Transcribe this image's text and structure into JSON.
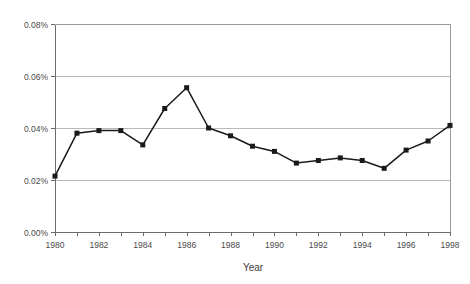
{
  "chart_data": {
    "type": "line",
    "title": "",
    "subtitle": "",
    "xlabel": "Year",
    "ylabel": "",
    "x": [
      1980,
      1981,
      1982,
      1983,
      1984,
      1985,
      1986,
      1987,
      1988,
      1989,
      1990,
      1991,
      1992,
      1993,
      1994,
      1995,
      1996,
      1997,
      1998
    ],
    "values": [
      0.0215,
      0.038,
      0.039,
      0.039,
      0.0335,
      0.0475,
      0.0555,
      0.04,
      0.037,
      0.033,
      0.031,
      0.0265,
      0.0275,
      0.0285,
      0.0275,
      0.0245,
      0.0315,
      0.035,
      0.041
    ],
    "value_unit": "percent",
    "series": [
      {
        "name": "",
        "values": [
          0.0215,
          0.038,
          0.039,
          0.039,
          0.0335,
          0.0475,
          0.0555,
          0.04,
          0.037,
          0.033,
          0.031,
          0.0265,
          0.0275,
          0.0285,
          0.0275,
          0.0245,
          0.0315,
          0.035,
          0.041
        ],
        "marker": "square",
        "color": "#1a1a1a"
      }
    ],
    "ylim": [
      0.0,
      0.08
    ],
    "xlim": [
      1980,
      1998
    ],
    "ytick_values": [
      0.0,
      0.02,
      0.04,
      0.06,
      0.08
    ],
    "ytick_labels": [
      "0.00%",
      "0.02%",
      "0.04%",
      "0.06%",
      "0.08%"
    ],
    "xtick_values": [
      1980,
      1981,
      1982,
      1983,
      1984,
      1985,
      1986,
      1987,
      1988,
      1989,
      1990,
      1991,
      1992,
      1993,
      1994,
      1995,
      1996,
      1997,
      1998
    ],
    "xtick_labels_shown": [
      "1980",
      "1982",
      "1984",
      "1986",
      "1988",
      "1990",
      "1992",
      "1994",
      "1996",
      "1998"
    ],
    "xtick_label_values": [
      1980,
      1982,
      1984,
      1986,
      1988,
      1990,
      1992,
      1994,
      1996,
      1998
    ],
    "grid": {
      "horizontal": true,
      "vertical": false
    },
    "legend": {
      "visible": false,
      "position": "none"
    },
    "colors": {
      "line": "#1a1a1a",
      "marker": "#1a1a1a",
      "grid": "#b9b9b9",
      "frame": "#9a9a9a",
      "axis": "#6b6b6b",
      "text": "#4a4a4a",
      "background": "#ffffff"
    }
  }
}
